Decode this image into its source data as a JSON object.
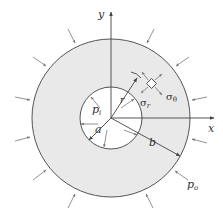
{
  "figure": {
    "colors": {
      "background": "#ffffff",
      "annulus_fill": "#e9e9e9",
      "stroke": "#444444",
      "text": "#333333"
    },
    "axes": {
      "x_label": "x",
      "y_label": "y"
    },
    "labels": {
      "inner_pressure": "p",
      "inner_pressure_sub": "i",
      "outer_pressure": "p",
      "outer_pressure_sub": "o",
      "inner_radius": "a",
      "outer_radius": "b",
      "radius": "r",
      "radial_stress": "σ",
      "radial_stress_sub": "r",
      "tangential_stress": "σ",
      "tangential_stress_sub": "θ"
    }
  }
}
